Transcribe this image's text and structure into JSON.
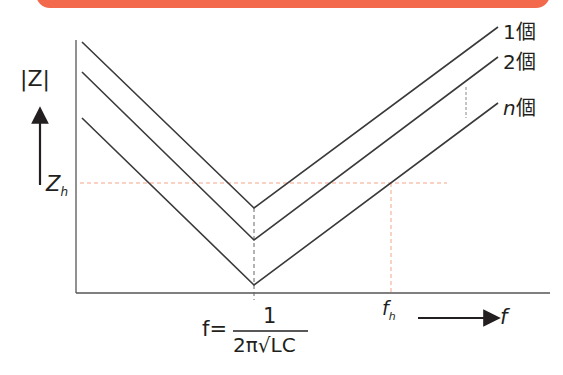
{
  "banner": {
    "color": "#f26a4b"
  },
  "diagram": {
    "y_axis_label": "|Z|",
    "x_axis_label": "f",
    "y_marker": "Z",
    "y_marker_sub": "h",
    "x_marker": "f",
    "x_marker_sub": "h",
    "resonance_lhs": "f=",
    "resonance_numerator": "1",
    "resonance_denominator": "2π√LC",
    "curves": [
      {
        "label": "1個",
        "count": "1",
        "suffix": "個"
      },
      {
        "label": "2個",
        "count": "2",
        "suffix": "個"
      },
      {
        "label": "n個",
        "count": "n",
        "suffix": "個"
      }
    ],
    "colors": {
      "line": "#3a3a3a",
      "guide": "#f4a58a",
      "dashed": "#888888"
    }
  }
}
